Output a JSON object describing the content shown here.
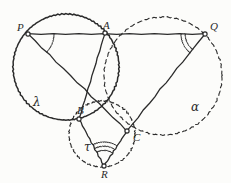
{
  "figure": {
    "background_color": "#fcfcfa",
    "ink_color": "#2b2b2b"
  },
  "points": [
    {
      "id": "P",
      "label": "P",
      "x": 28,
      "y": 34,
      "label_dx": -11,
      "label_dy": -12
    },
    {
      "id": "A",
      "label": "A",
      "x": 105,
      "y": 33,
      "label_dx": -2,
      "label_dy": -13
    },
    {
      "id": "Q",
      "label": "Q",
      "x": 205,
      "y": 34,
      "label_dx": 5,
      "label_dy": -13
    },
    {
      "id": "B",
      "label": "B",
      "x": 79,
      "y": 119,
      "label_dx": -2,
      "label_dy": -14
    },
    {
      "id": "C",
      "label": "C",
      "x": 127,
      "y": 131,
      "label_dx": 6,
      "label_dy": 1
    },
    {
      "id": "R",
      "label": "R",
      "x": 104,
      "y": 166,
      "label_dx": -3,
      "label_dy": 3
    }
  ],
  "circles": [
    {
      "id": "lambda",
      "label": "λ",
      "style": "solid",
      "cx": 66,
      "cy": 67,
      "r": 53,
      "label_x": 33,
      "label_y": 96,
      "through": [
        "P",
        "A",
        "B"
      ]
    },
    {
      "id": "alpha",
      "label": "α",
      "style": "dashed",
      "cx": 163,
      "cy": 76,
      "r": 59,
      "label_x": 191,
      "label_y": 101,
      "through": [
        "A",
        "Q",
        "C"
      ]
    },
    {
      "id": "tau",
      "label": "τ",
      "style": "dashed",
      "cx": 102,
      "cy": 134,
      "r": 33,
      "label_x": 84,
      "label_y": 141,
      "through": [
        "B",
        "C",
        "R"
      ]
    }
  ],
  "segments": [
    {
      "id": "PQ",
      "from": "P",
      "to": "Q",
      "style": "solid"
    },
    {
      "id": "PC",
      "from": "P",
      "to": "C",
      "style": "solid"
    },
    {
      "id": "QC",
      "from": "Q",
      "to": "C",
      "style": "solid"
    },
    {
      "id": "AB",
      "from": "A",
      "to": "B",
      "style": "solid"
    },
    {
      "id": "BR",
      "from": "B",
      "to": "R",
      "style": "solid"
    },
    {
      "id": "CR",
      "from": "C",
      "to": "R",
      "style": "solid"
    }
  ],
  "angle_marks": [
    {
      "id": "angle-P",
      "vertex": "P",
      "arcs": 1,
      "radius": 26
    },
    {
      "id": "angle-Q",
      "vertex": "Q",
      "arcs": 2,
      "radius": 24
    },
    {
      "id": "angle-R",
      "vertex": "R",
      "arcs": 3,
      "radius": 24
    }
  ]
}
